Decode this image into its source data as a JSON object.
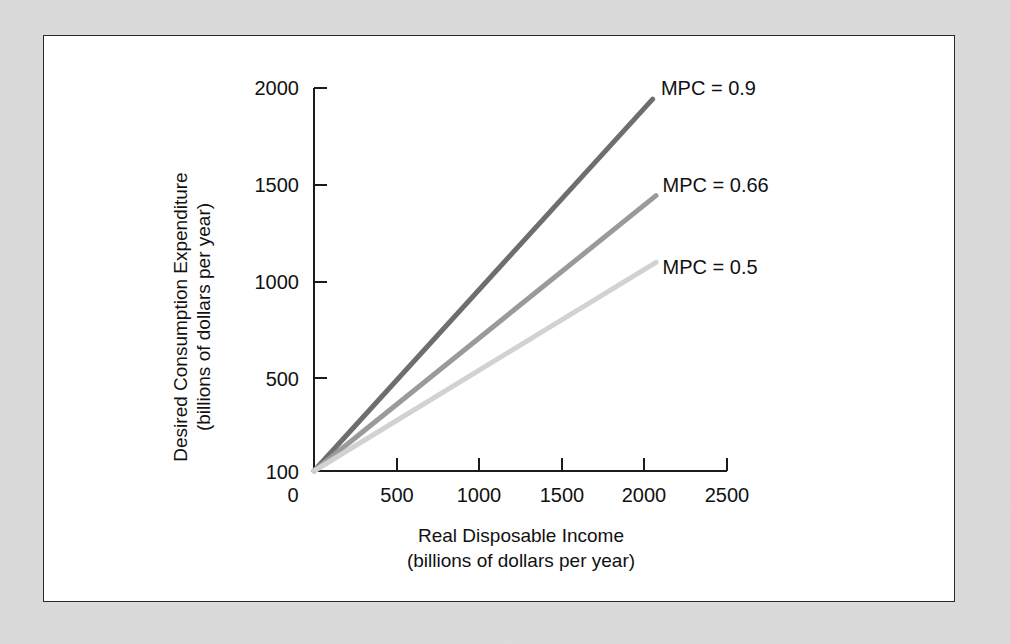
{
  "figure": {
    "panel_background": "#ffffff",
    "page_background": "#d5d5d5",
    "border_color": "#2a2a2a"
  },
  "chart_data": {
    "type": "line",
    "title": "",
    "xlabel": "Real Disposable Income",
    "xlabel_sub": "(billions of dollars per year)",
    "ylabel": "Desired Consumption Expenditure",
    "ylabel_sub": "(billions of dollars per year)",
    "xlim": [
      0,
      2500
    ],
    "ylim": [
      100,
      2000
    ],
    "xticks": [
      0,
      500,
      1000,
      1500,
      2000,
      2500
    ],
    "xtick_labels": [
      "0",
      "500",
      "1000",
      "1500",
      "2000",
      "2500"
    ],
    "yticks": [
      100,
      500,
      1000,
      1500,
      2000
    ],
    "ytick_labels": [
      "100",
      "500",
      "1000",
      "1500",
      "2000"
    ],
    "grid": false,
    "legend_position": "inline-right-of-line-ends",
    "autonomous_consumption": 100,
    "series": [
      {
        "name": "MPC = 0.9",
        "mpc": 0.9,
        "color": "#6e6e6e",
        "stroke_width": 5,
        "x": [
          0,
          2050
        ],
        "values": [
          100,
          1945
        ],
        "label_x": 2100,
        "label_y": 2000
      },
      {
        "name": "MPC = 0.66",
        "mpc": 0.66,
        "color": "#9a9a9a",
        "stroke_width": 5,
        "x": [
          0,
          2070
        ],
        "values": [
          100,
          1466
        ],
        "label_x": 2110,
        "label_y": 1520
      },
      {
        "name": "MPC = 0.5",
        "mpc": 0.5,
        "color": "#d2d2d2",
        "stroke_width": 5,
        "x": [
          0,
          2070
        ],
        "values": [
          100,
          1135
        ],
        "label_x": 2110,
        "label_y": 1110
      }
    ]
  }
}
